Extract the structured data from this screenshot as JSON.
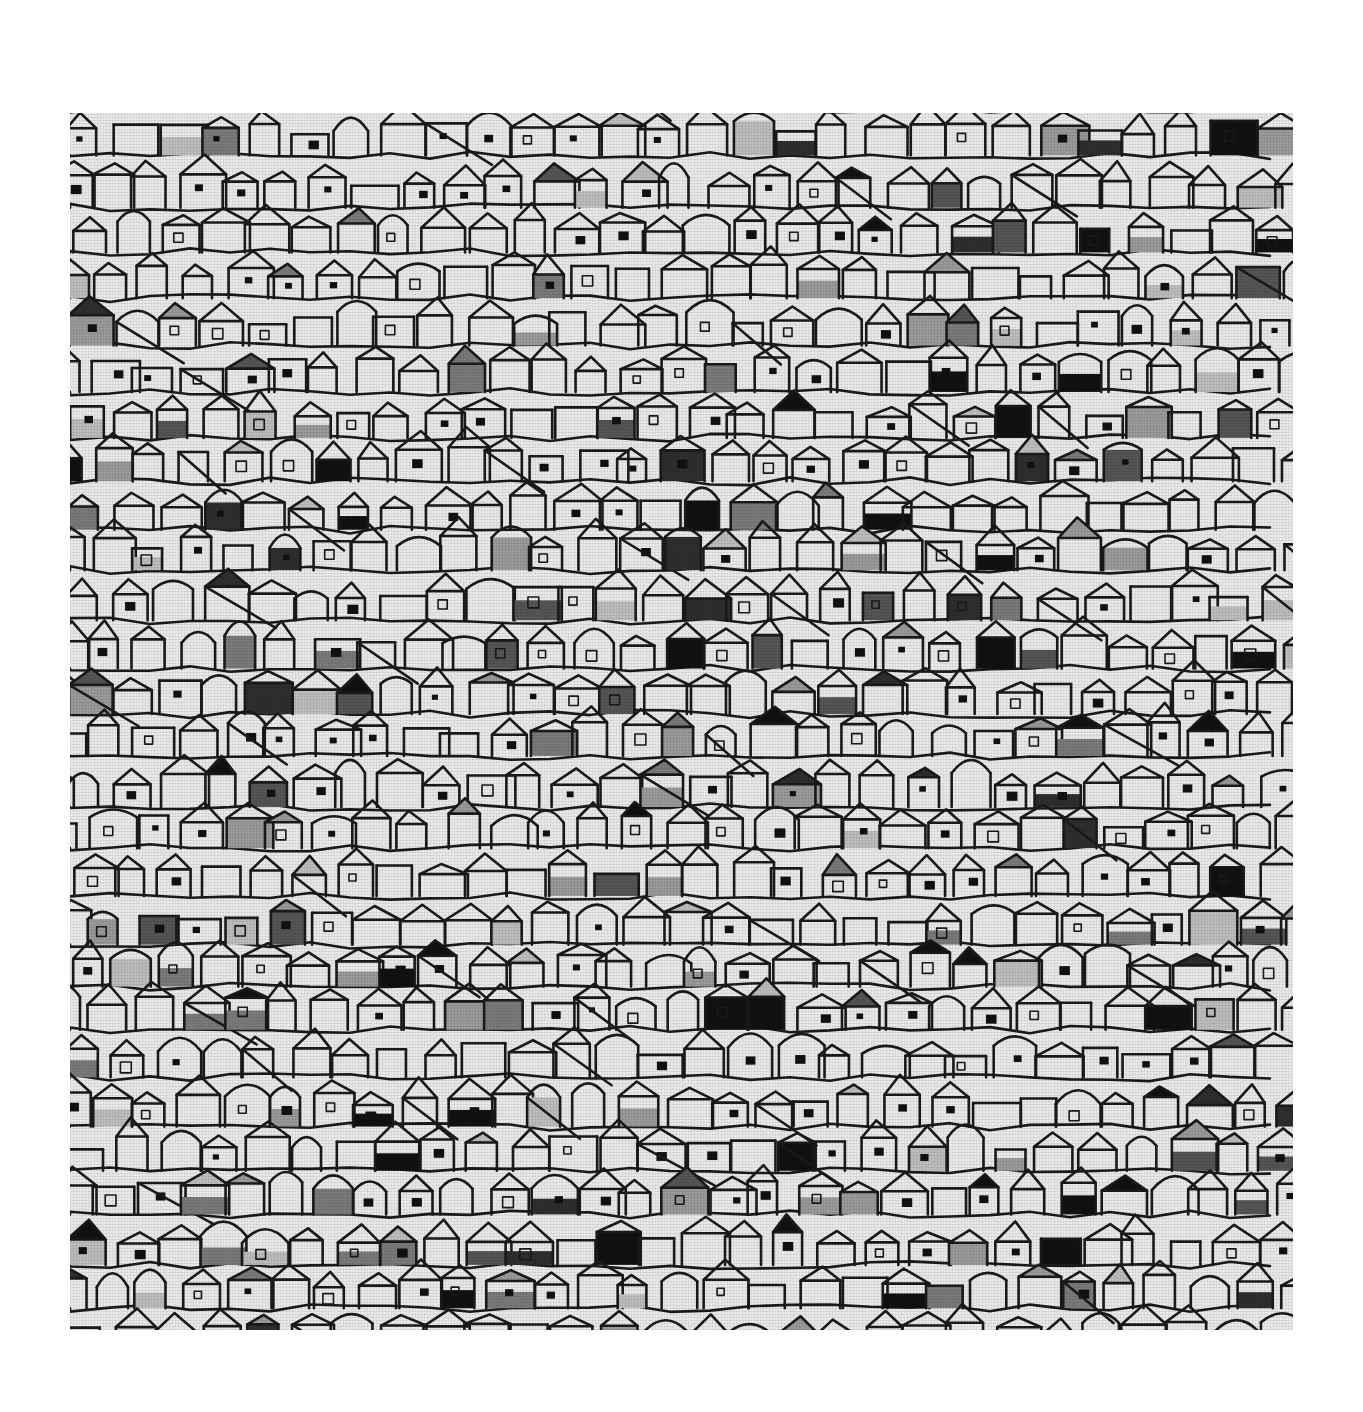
{
  "image": {
    "subject": "fabric swatch with hand-drawn house pattern",
    "tone": "grayscale",
    "background": "#ffffff",
    "swatch": {
      "left": 70,
      "top": 113,
      "width": 1223,
      "height": 1217
    },
    "palette": {
      "fabric": "#e9e9e9",
      "outline": "#1a1a1a",
      "fills": [
        "#bdbdbd",
        "#9a9a9a",
        "#7a7a7a",
        "#555555",
        "#2e2e2e",
        "#111111"
      ]
    },
    "pattern": {
      "motif": "house",
      "cell_width": 44,
      "cell_height": 46,
      "seed": 7
    }
  }
}
